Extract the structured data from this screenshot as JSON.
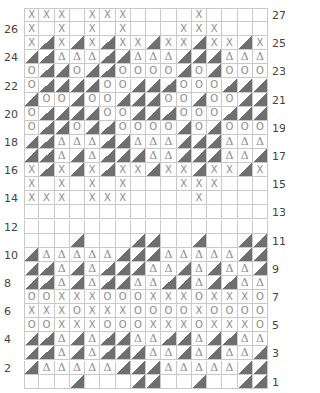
{
  "chart": {
    "title": "",
    "columns": 16,
    "legend": {
      "X": "x-stitch",
      "O": "o-stitch",
      "D": "delta-stitch",
      "T": "shaded-triangle-stitch",
      ".": "empty"
    },
    "colors": {
      "triangle_fill": "#6f6f6f",
      "symbol": "#8a8a8a",
      "grid": "#c9c9c9",
      "label": "#444444"
    },
    "rows": [
      {
        "number": "27",
        "side": "right",
        "cells": "XXX.XXX....X...."
      },
      {
        "number": "26",
        "side": "left",
        "cells": "X.X.X.X...XXX..."
      },
      {
        "number": "25",
        "side": "right",
        "cells": "XTXTXTXXTXXTXXTX"
      },
      {
        "number": "24",
        "side": "left",
        "cells": "TTDDDTTDDDTTTDDD"
      },
      {
        "number": "23",
        "side": "right",
        "cells": "OTTOTTOOOOTOTOOO"
      },
      {
        "number": "22",
        "side": "left",
        "cells": "OTTTTOOTTTOOOTTT"
      },
      {
        "number": "21",
        "side": "right",
        "cells": "TOOTOOTTTOOTOOTT"
      },
      {
        "number": "20",
        "side": "left",
        "cells": "OTTTTOOTTTOOOTTT"
      },
      {
        "number": "19",
        "side": "right",
        "cells": "OTTOTTOOOOTOTOOO"
      },
      {
        "number": "18",
        "side": "left",
        "cells": "TTDDDTTDDDTTTDDD"
      },
      {
        "number": "17",
        "side": "right",
        "cells": "TTDTDTTTDDTTTDDT"
      },
      {
        "number": "16",
        "side": "left",
        "cells": "XTXTXTXXTXXTXXTX"
      },
      {
        "number": "15",
        "side": "right",
        "cells": "X.X.X.X...XXX..."
      },
      {
        "number": "14",
        "side": "left",
        "cells": "XXX.XXX....X...."
      },
      {
        "number": "13",
        "side": "right",
        "cells": "................"
      },
      {
        "number": "12",
        "side": "left",
        "cells": "................"
      },
      {
        "number": "11",
        "side": "right",
        "cells": "...T...TT..T..TT"
      },
      {
        "number": "10",
        "side": "left",
        "cells": "TDDDDDTTTDDDDDTT"
      },
      {
        "number": "9",
        "side": "right",
        "cells": "TTDTDTTTDDTDTDDT"
      },
      {
        "number": "8",
        "side": "left",
        "cells": "TTDTDTTDDTTDTTDD"
      },
      {
        "number": "7",
        "side": "right",
        "cells": "OOXXXOOOXXXOXXXO"
      },
      {
        "number": "6",
        "side": "left",
        "cells": "XXXOXXXOOOOXOOOO"
      },
      {
        "number": "5",
        "side": "right",
        "cells": "OOXXXOOOXXXOXXXO"
      },
      {
        "number": "4",
        "side": "left",
        "cells": "TTDTDTTDDTTDTTDD"
      },
      {
        "number": "3",
        "side": "right",
        "cells": "TTDTDTTTDDTDTDDT"
      },
      {
        "number": "2",
        "side": "left",
        "cells": "TDDDDDTTTDDDDDTT"
      },
      {
        "number": "1",
        "side": "right",
        "cells": "...T...TT..T..TT"
      }
    ],
    "glyphs": {
      "X": "X",
      "O": "O",
      "D": "Δ"
    }
  }
}
